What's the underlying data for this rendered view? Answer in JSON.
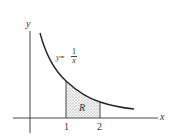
{
  "figure": {
    "x_axis_label": "x",
    "y_axis_label": "y",
    "curve_label_lhs": "y=",
    "curve_label_num": "1",
    "curve_label_den": "x",
    "region_label": "R",
    "ticks": [
      {
        "value": 1,
        "label": "1"
      },
      {
        "value": 2,
        "label": "2"
      }
    ],
    "colors": {
      "line": "#222222",
      "shade": "#cfcfcf",
      "text": "#333333"
    }
  }
}
